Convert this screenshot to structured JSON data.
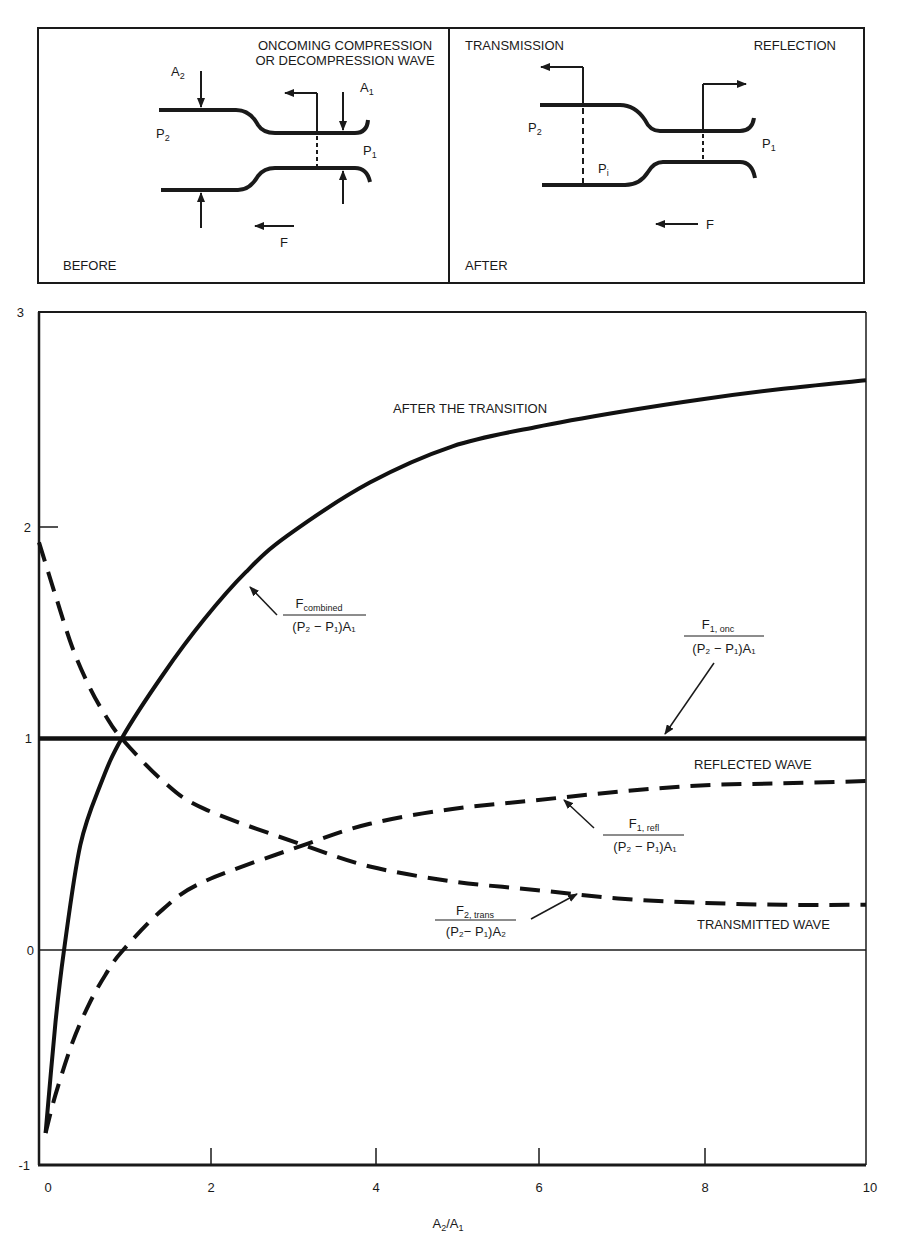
{
  "diagram": {
    "before_panel": {
      "title": "BEFORE",
      "wave_label_line1": "ONCOMING COMPRESSION",
      "wave_label_line2": "OR DECOMPRESSION WAVE",
      "a2_label": "A",
      "a2_sub": "2",
      "a1_label": "A",
      "a1_sub": "1",
      "p2_label": "P",
      "p2_sub": "2",
      "p1_label": "P",
      "p1_sub": "1",
      "force_label": "F"
    },
    "after_panel": {
      "title": "AFTER",
      "transmission_label": "TRANSMISSION",
      "reflection_label": "REFLECTION",
      "p2_label": "P",
      "p2_sub": "2",
      "pi_label": "P",
      "pi_sub": "i",
      "p1_label": "P",
      "p1_sub": "1",
      "force_label": "F"
    }
  },
  "chart_data": {
    "type": "line",
    "title": "",
    "xlabel": "A2/A1",
    "ylabel": "",
    "xlim": [
      0,
      10
    ],
    "ylim": [
      -1,
      3
    ],
    "x_ticks": [
      "0",
      "2",
      "4",
      "6",
      "8",
      "10"
    ],
    "y_ticks": [
      "-1",
      "0",
      "1",
      "2",
      "3"
    ],
    "grid": false,
    "series": [
      {
        "name": "F_combined / ((P2 - P1) A1)",
        "style": "solid-thick",
        "x": [
          0.08,
          0.2,
          0.3,
          0.5,
          0.75,
          1.0,
          1.5,
          2.0,
          2.5,
          3.0,
          4.0,
          5.0,
          6.0,
          7.0,
          8.0,
          9.0,
          10.0
        ],
        "values": [
          -0.85,
          -0.33,
          0.0,
          0.5,
          0.79,
          1.0,
          1.3,
          1.56,
          1.78,
          1.95,
          2.2,
          2.37,
          2.46,
          2.53,
          2.59,
          2.64,
          2.68
        ]
      },
      {
        "name": "F_1,onc / ((P2 - P1) A1)",
        "style": "solid-thick",
        "x": [
          0,
          10
        ],
        "values": [
          1.0,
          1.0
        ]
      },
      {
        "name": "F_1,refl / ((P2 - P1) A1)",
        "style": "dashed",
        "x": [
          0.08,
          0.2,
          0.4,
          0.6,
          0.8,
          1.0,
          1.5,
          2.0,
          3.2,
          4.0,
          5.0,
          6.0,
          7.0,
          8.0,
          9.0,
          10.0
        ],
        "values": [
          -0.85,
          -0.67,
          -0.43,
          -0.25,
          -0.11,
          0.0,
          0.2,
          0.33,
          0.5,
          0.6,
          0.67,
          0.71,
          0.75,
          0.78,
          0.79,
          0.8
        ]
      },
      {
        "name": "F_2,trans / ((P2 - P1) A2)",
        "style": "dashed",
        "x": [
          0.0,
          0.2,
          0.4,
          0.6,
          0.8,
          1.0,
          1.5,
          2.0,
          3.2,
          4.0,
          5.0,
          6.0,
          7.0,
          8.0,
          9.0,
          10.0
        ],
        "values": [
          1.92,
          1.67,
          1.43,
          1.25,
          1.11,
          1.0,
          0.8,
          0.67,
          0.5,
          0.4,
          0.33,
          0.29,
          0.25,
          0.23,
          0.22,
          0.22
        ]
      }
    ],
    "annotations": [
      "AFTER THE TRANSITION",
      "REFLECTED WAVE",
      "TRANSMITTED WAVE"
    ],
    "curve_labels": {
      "combined": {
        "num": "F",
        "num_sub": "combined",
        "den": "(P₂ − P₁)A₁"
      },
      "onc": {
        "num": "F",
        "num_sub": "1, onc",
        "den": "(P₂ − P₁)A₁"
      },
      "refl": {
        "num": "F",
        "num_sub": "1, refl",
        "den": "(P₂ − P₁)A₁"
      },
      "trans": {
        "num": "F",
        "num_sub": "2, trans",
        "den": "(P₂− P₁)A₂"
      }
    }
  }
}
